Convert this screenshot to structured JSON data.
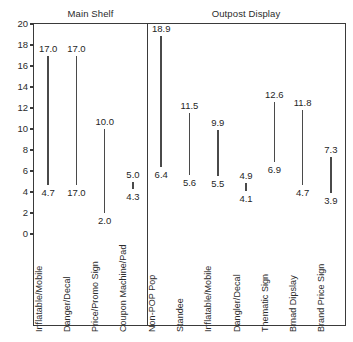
{
  "chart_data": {
    "type": "bar",
    "title": "",
    "subtitle": "",
    "xlabel": "",
    "ylabel": "",
    "ylim": [
      0,
      20
    ],
    "yticks": [
      "0",
      "2",
      "4",
      "6",
      "8",
      "10",
      "12",
      "14",
      "16",
      "18",
      "20"
    ],
    "grid": false,
    "legend": "none",
    "orientation": "vertical-range-bars",
    "note": "Each category is drawn as a vertical range line annotated with an upper value label and a lower value label.",
    "panels": [
      {
        "name": "Main Shelf",
        "categories": [
          "Inflatable/Mobile",
          "Danger/Decal",
          "Price/Promo Sign",
          "Coupon Machine/Pad"
        ],
        "upper_values": [
          17.0,
          17.0,
          10.0,
          5.0
        ],
        "lower_values": [
          4.7,
          17.0,
          2.0,
          4.3
        ],
        "upper_labels": [
          "17.0",
          "17.0",
          "10.0",
          "5.0"
        ],
        "lower_labels": [
          "4.7",
          "17.0",
          "2.0",
          "4.3"
        ],
        "bar_top_plot": [
          17.0,
          17.0,
          10.0,
          5.0
        ],
        "bar_bottom_plot": [
          4.7,
          4.7,
          2.0,
          4.3
        ]
      },
      {
        "name": "Outpost Display",
        "categories": [
          "Non-POP Pop",
          "Standee",
          "Inflatable/Mobile",
          "Dangler/Decal",
          "Thematic Sign",
          "Brnad Dipslay",
          "Brand Price Sign"
        ],
        "upper_values": [
          18.9,
          11.5,
          9.9,
          4.9,
          12.6,
          11.8,
          7.3
        ],
        "lower_values": [
          6.4,
          5.6,
          5.5,
          4.1,
          6.9,
          4.7,
          3.9
        ],
        "upper_labels": [
          "18.9",
          "11.5",
          "9.9",
          "4.9",
          "12.6",
          "11.8",
          "7.3"
        ],
        "lower_labels": [
          "6.4",
          "5.6",
          "5.5",
          "4.1",
          "6.9",
          "4.7",
          "3.9"
        ],
        "bar_top_plot": [
          18.9,
          11.5,
          9.9,
          4.9,
          12.6,
          11.8,
          7.3
        ],
        "bar_bottom_plot": [
          6.4,
          5.6,
          5.5,
          4.1,
          6.9,
          4.7,
          3.9
        ]
      }
    ],
    "colors": {
      "bar": "#4a4a4a",
      "axis": "#3a3a3a",
      "text": "#1f1f1f",
      "background": "#ffffff"
    }
  }
}
